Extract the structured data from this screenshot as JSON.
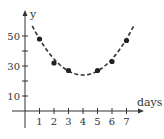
{
  "chart_data": {
    "type": "scatter",
    "title": "",
    "xlabel": "days",
    "ylabel": "y",
    "xlim": [
      -0.3,
      8.2
    ],
    "ylim": [
      -12,
      66
    ],
    "x_ticks": [
      1,
      2,
      3,
      4,
      5,
      6,
      7
    ],
    "x_tick_labels": [
      "1",
      "2",
      "3",
      "4",
      "5",
      "6",
      "7"
    ],
    "y_ticks": [
      10,
      20,
      30,
      40,
      50
    ],
    "y_tick_labels": [
      "10",
      "",
      "30",
      "",
      "50"
    ],
    "grid": false,
    "legend": null,
    "series": [
      {
        "name": "data points",
        "kind": "scatter",
        "x": [
          1,
          2,
          3,
          5,
          6,
          7
        ],
        "y": [
          48,
          32,
          27,
          27,
          33,
          47
        ],
        "marker": "filled-circle"
      },
      {
        "name": "fitted curve",
        "kind": "line",
        "style": "dashed",
        "equation": "y = 2.67(x - 4)^2 + 24",
        "x_range": [
          0.5,
          7.5
        ],
        "vertex": [
          4,
          24
        ]
      }
    ],
    "colors": {
      "ink": "#333333",
      "background": "#ffffff"
    }
  }
}
